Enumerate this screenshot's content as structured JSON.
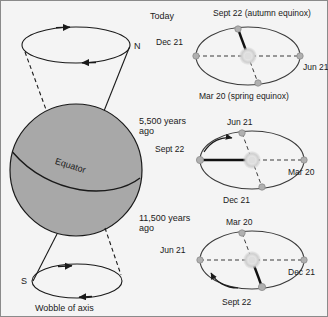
{
  "figure": {
    "background_color": "#f4f4f4",
    "border_color": "#8a8a8a",
    "earth_fill": "#a8a8a8",
    "line_color": "#1a1a1a",
    "sun_color": "#d9d9d9",
    "node_color": "#b0b0b0"
  },
  "wobble": {
    "north_label": "N",
    "south_label": "S",
    "equator_label": "Equator",
    "caption": "Wobble of axis"
  },
  "orbits": [
    {
      "era_label": "Today",
      "era_label_line2": "",
      "top_label": "Sept 22 (autumn equinox)",
      "left_label": "Dec 21",
      "right_label": "Jun 21",
      "bottom_label": "Mar 20 (spring equinox)",
      "tilt_axis_toward": "top",
      "has_precession_arrow": false
    },
    {
      "era_label": "5,500 years",
      "era_label_line2": "ago",
      "top_label": "Jun 21",
      "left_label": "Sept 22",
      "right_label": "Mar 20",
      "bottom_label": "Dec 21",
      "tilt_axis_toward": "left",
      "has_precession_arrow": true
    },
    {
      "era_label": "11,500 years",
      "era_label_line2": "ago",
      "top_label": "Mar 20",
      "left_label": "Jun 21",
      "right_label": "Dec 21",
      "bottom_label": "Sept 22",
      "tilt_axis_toward": "bottom",
      "has_precession_arrow": true
    }
  ]
}
